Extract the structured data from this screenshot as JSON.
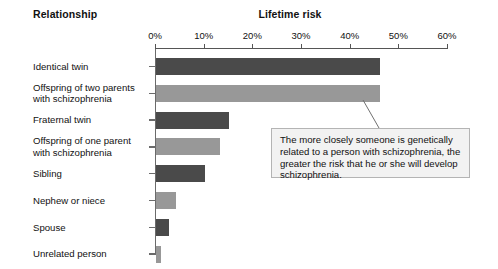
{
  "headers": {
    "relationship": "Relationship",
    "lifetime_risk": "Lifetime risk"
  },
  "callout": {
    "text": "The more closely someone is genetically related to a person with schizophrenia, the greater the risk that he or she will develop schizophrenia."
  },
  "colors": {
    "bar_dark": "#4a4a4a",
    "bar_light": "#989898",
    "axis": "#555555",
    "callout_bg": "#f2f2f2",
    "callout_border": "#b4b4b4",
    "text": "#111111"
  },
  "chart_data": {
    "type": "bar",
    "orientation": "horizontal",
    "title": "Lifetime risk",
    "xlabel": "Lifetime risk",
    "ylabel": "Relationship",
    "xlim": [
      0,
      60
    ],
    "grid": false,
    "legend": "none",
    "tick_labels": [
      "0%",
      "10%",
      "20%",
      "30%",
      "40%",
      "50%",
      "60%"
    ],
    "tick_values": [
      0,
      10,
      20,
      30,
      40,
      50,
      60
    ],
    "categories": [
      "Identical twin",
      "Offspring of two parents\nwith schizophrenia",
      "Fraternal twin",
      "Offspring of one parent\nwith schizophrenia",
      "Sibling",
      "Nephew or niece",
      "Spouse",
      "Unrelated person"
    ],
    "values": [
      46,
      46,
      15,
      13,
      10,
      4,
      2.5,
      1
    ],
    "value_unit": "%",
    "bar_colors": [
      "#4a4a4a",
      "#989898",
      "#4a4a4a",
      "#989898",
      "#4a4a4a",
      "#989898",
      "#4a4a4a",
      "#989898"
    ],
    "annotations": [
      {
        "text": "The more closely someone is genetically related to a person with schizophrenia, the greater the risk that he or she will develop schizophrenia.",
        "points_to": "Offspring of two parents with schizophrenia"
      }
    ]
  }
}
